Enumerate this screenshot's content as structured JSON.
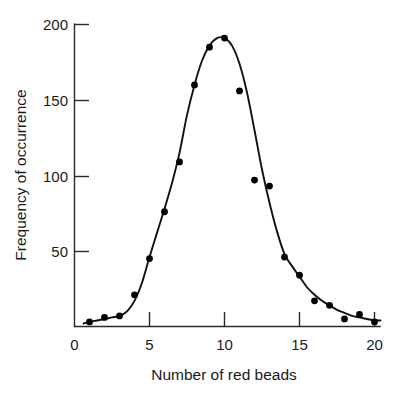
{
  "chart_data": {
    "type": "scatter",
    "title": "",
    "xlabel": "Number of red beads",
    "ylabel": "Frequency of occurrence",
    "xlim": [
      0,
      20.6
    ],
    "ylim": [
      0,
      205
    ],
    "grid": false,
    "legend": null,
    "x_ticks": [
      0,
      5,
      10,
      15,
      20
    ],
    "x_tick_labels": [
      "0",
      "5",
      "10",
      "15",
      "20"
    ],
    "y_ticks": [
      50,
      100,
      150,
      200
    ],
    "y_tick_labels": [
      "50",
      "100",
      "150",
      "200"
    ],
    "series": [
      {
        "name": "Frequency of occurrence",
        "marker": "filled-circle",
        "color": "#000000",
        "x": [
          1,
          2,
          3,
          4,
          5,
          6,
          7,
          8,
          9,
          10,
          11,
          12,
          13,
          14,
          15,
          16,
          17,
          18,
          19,
          20
        ],
        "values": [
          3,
          6,
          7,
          21,
          45,
          76,
          109,
          160,
          185,
          191,
          156,
          97,
          93,
          46,
          34,
          17,
          14,
          5,
          8,
          3
        ]
      },
      {
        "name": "fitted curve",
        "marker": "none",
        "color": "#111111",
        "x": [
          0.6,
          1.0,
          1.5,
          2.0,
          2.5,
          3.0,
          3.5,
          4.0,
          4.5,
          5.0,
          5.5,
          6.0,
          6.5,
          7.0,
          7.5,
          8.0,
          8.5,
          9.0,
          9.5,
          10.0,
          10.5,
          11.0,
          11.5,
          12.0,
          12.5,
          13.0,
          13.5,
          14.0,
          14.5,
          15.0,
          15.5,
          16.0,
          16.5,
          17.0,
          17.5,
          18.0,
          18.5,
          19.0,
          19.5,
          20.0,
          20.4
        ],
        "values": [
          2,
          3,
          4,
          5,
          6,
          7,
          10,
          17,
          29,
          46,
          62,
          78,
          95,
          115,
          140,
          160,
          176,
          186,
          191,
          191,
          186,
          174,
          155,
          130,
          104,
          82,
          63,
          48,
          40,
          33,
          26,
          21,
          17,
          14,
          11,
          9,
          7,
          6,
          5,
          4,
          4
        ]
      }
    ]
  },
  "axis": {
    "x_label": "Number of red beads",
    "y_label": "Frequency of occurrence"
  }
}
